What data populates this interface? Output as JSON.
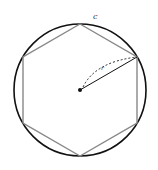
{
  "diagram": {
    "circle": {
      "label": "c",
      "cx": 80,
      "cy": 90,
      "r": 66,
      "stroke": "#111111"
    },
    "hexagon": {
      "points": "80,24 137,57 137,123 80,156 23,123 23,57",
      "stroke": "#888888"
    },
    "center": {
      "x": 80,
      "y": 90
    },
    "radius": {
      "label": "r",
      "to": {
        "x": 137,
        "y": 57
      },
      "stroke": "#111111"
    },
    "labels": {
      "circle": "c",
      "radius": "r"
    }
  }
}
